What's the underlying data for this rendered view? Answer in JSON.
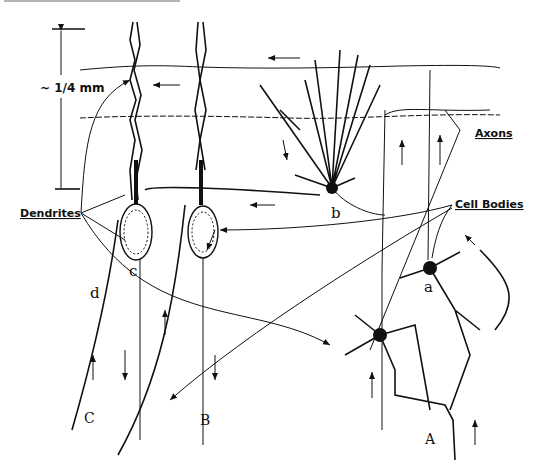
{
  "figure": {
    "scale_label": "~ 1/4 mm",
    "labels": {
      "dendrites": "Dendrites",
      "axons": "Axons",
      "cell_bodies": "Cell Bodies"
    },
    "cell_letters": {
      "a": "a",
      "b": "b",
      "c": "c",
      "d": "d"
    },
    "column_letters": {
      "A": "A",
      "B": "B",
      "C": "C"
    }
  },
  "colors": {
    "ink": "#111111",
    "background": "#ffffff"
  }
}
